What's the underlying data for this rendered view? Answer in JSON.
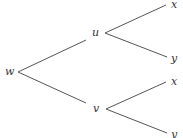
{
  "diagram": {
    "type": "tree",
    "nodes": {
      "root": "w",
      "upper_mid": "u",
      "lower_mid": "v",
      "upper_top_leaf": "x",
      "upper_bottom_leaf": "y",
      "lower_top_leaf": "x",
      "lower_bottom_leaf": "y"
    },
    "edges": [
      [
        "w",
        "u"
      ],
      [
        "w",
        "v"
      ],
      [
        "u",
        "x"
      ],
      [
        "u",
        "y"
      ],
      [
        "v",
        "x"
      ],
      [
        "v",
        "y"
      ]
    ]
  }
}
